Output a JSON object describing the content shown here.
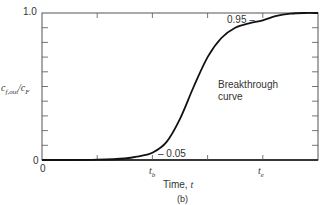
{
  "chart_data": {
    "type": "line",
    "title": "",
    "caption": "(b)",
    "xlabel": "Time, t",
    "ylabel": "c_f,out/c_F",
    "xlim": [
      0,
      5
    ],
    "ylim": [
      0,
      1.0
    ],
    "x_tick_labels": [
      {
        "x": 0,
        "label": "0"
      },
      {
        "x": 2.0,
        "label": "t_b"
      },
      {
        "x": 4.0,
        "label": "t_e"
      }
    ],
    "y_tick_labels": [
      {
        "y": 0,
        "label": "0"
      },
      {
        "y": 1.0,
        "label": "1.0"
      }
    ],
    "x_minor_ticks": 5,
    "y_minor_ticks": 10,
    "grid": false,
    "annotations": [
      {
        "text": "Breakthrough curve",
        "x": 3.0,
        "y": 0.6
      },
      {
        "text": "0.05",
        "x": 2.0,
        "y": 0.05
      },
      {
        "text": "0.95",
        "x": 4.0,
        "y": 0.95
      }
    ],
    "series": [
      {
        "name": "Breakthrough curve",
        "x": [
          0,
          0.5,
          1.0,
          1.5,
          1.75,
          2.0,
          2.25,
          2.5,
          2.75,
          3.0,
          3.25,
          3.5,
          3.75,
          4.0,
          4.25,
          4.5,
          4.75,
          5.0
        ],
        "y": [
          0,
          0,
          0.002,
          0.01,
          0.025,
          0.05,
          0.12,
          0.28,
          0.5,
          0.7,
          0.83,
          0.9,
          0.93,
          0.95,
          0.98,
          0.995,
          1.0,
          1.0
        ]
      }
    ]
  },
  "labels": {
    "y_top": "1.0",
    "y_zero": "0",
    "x_zero": "0",
    "ylabel_main": "c",
    "ylabel_sub1": "f,out",
    "ylabel_sep": "/c",
    "ylabel_sub2": "F",
    "tb_main": "t",
    "tb_sub": "b",
    "te_main": "t",
    "te_sub": "e",
    "xlabel_text": "Time, ",
    "xlabel_var": "t",
    "caption": "(b)",
    "annot_curve_1": "Breakthrough",
    "annot_curve_2": "curve",
    "annot_low": "– 0.05",
    "annot_high": "0.95 –"
  }
}
